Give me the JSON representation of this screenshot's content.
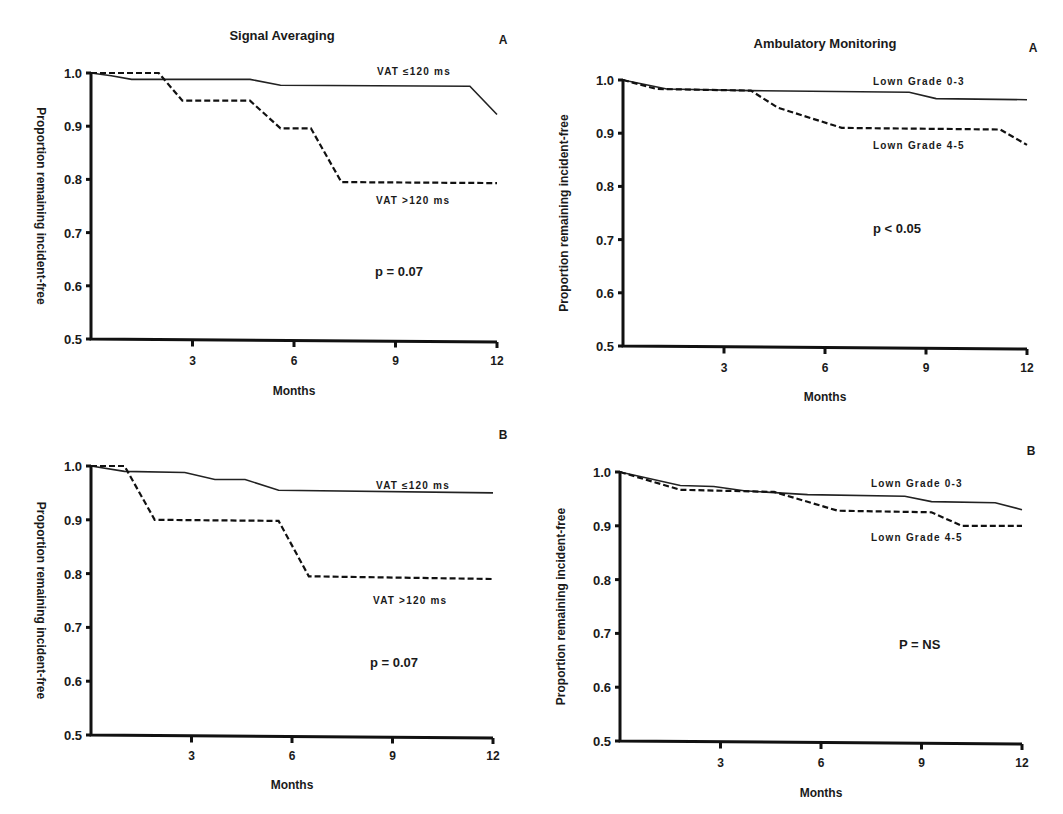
{
  "figure": {
    "left_column_title": "Signal Averaging",
    "right_column_title": "Ambulatory Monitoring"
  },
  "chart_data": [
    {
      "id": "signal-averaging-A",
      "type": "line",
      "title": "Signal Averaging",
      "panel_label": "A",
      "xlabel": "Months",
      "ylabel": "Proportion remaining incident-free",
      "xlim": [
        0,
        12
      ],
      "ylim": [
        0.5,
        1.0
      ],
      "xticks": [
        "3",
        "6",
        "9",
        "12"
      ],
      "yticks": [
        "1.0",
        "0.9",
        "0.8",
        "0.7",
        "0.6",
        "0.5"
      ],
      "grid": false,
      "annotation": "p = 0.07",
      "series": [
        {
          "name": "VAT ≤120 ms",
          "style": "solid",
          "x": [
            0,
            0.6,
            1.2,
            4.7,
            5.6,
            11.2,
            12
          ],
          "y": [
            1.0,
            0.995,
            0.988,
            0.988,
            0.977,
            0.975,
            0.922
          ]
        },
        {
          "name": "VAT >120 ms",
          "style": "dashed",
          "x": [
            0,
            2.0,
            2.7,
            4.7,
            5.6,
            6.5,
            7.4,
            12
          ],
          "y": [
            1.0,
            1.0,
            0.948,
            0.948,
            0.896,
            0.896,
            0.795,
            0.793
          ]
        }
      ]
    },
    {
      "id": "ambulatory-monitoring-A",
      "type": "line",
      "title": "Ambulatory Monitoring",
      "panel_label": "A",
      "xlabel": "Months",
      "ylabel": "Proportion remaining incident-free",
      "xlim": [
        0,
        12
      ],
      "ylim": [
        0.5,
        1.0
      ],
      "xticks": [
        "3",
        "6",
        "9",
        "12"
      ],
      "yticks": [
        "1.0",
        "0.9",
        "0.8",
        "0.7",
        "0.6",
        "0.5"
      ],
      "grid": false,
      "annotation": "p < 0.05",
      "series": [
        {
          "name": "Lown Grade 0-3",
          "style": "solid",
          "x": [
            0,
            1.3,
            3.8,
            8.5,
            9.3,
            12
          ],
          "y": [
            1.0,
            0.983,
            0.98,
            0.977,
            0.965,
            0.963
          ]
        },
        {
          "name": "Lown Grade 4-5",
          "style": "dashed",
          "x": [
            0,
            1.0,
            3.8,
            4.6,
            6.5,
            11.2,
            12
          ],
          "y": [
            1.0,
            0.983,
            0.98,
            0.948,
            0.91,
            0.907,
            0.878
          ]
        }
      ]
    },
    {
      "id": "signal-averaging-B",
      "type": "line",
      "title": "",
      "panel_label": "B",
      "xlabel": "Months",
      "ylabel": "Proportion remaining incident-free",
      "xlim": [
        0,
        12
      ],
      "ylim": [
        0.5,
        1.0
      ],
      "xticks": [
        "3",
        "6",
        "9",
        "12"
      ],
      "yticks": [
        "1.0",
        "0.9",
        "0.8",
        "0.7",
        "0.6",
        "0.5"
      ],
      "grid": false,
      "annotation": "p = 0.07",
      "series": [
        {
          "name": "VAT ≤120 ms",
          "style": "solid",
          "x": [
            0,
            1.0,
            2.8,
            3.7,
            4.6,
            5.6,
            12
          ],
          "y": [
            1.0,
            0.99,
            0.988,
            0.975,
            0.975,
            0.955,
            0.95
          ]
        },
        {
          "name": "VAT >120 ms",
          "style": "dashed",
          "x": [
            0,
            1.0,
            1.9,
            5.6,
            6.5,
            12
          ],
          "y": [
            1.0,
            1.0,
            0.9,
            0.898,
            0.795,
            0.79
          ]
        }
      ]
    },
    {
      "id": "ambulatory-monitoring-B",
      "type": "line",
      "title": "",
      "panel_label": "B",
      "xlabel": "Months",
      "ylabel": "Proportion remaining incident-free",
      "xlim": [
        0,
        12
      ],
      "ylim": [
        0.5,
        1.0
      ],
      "xticks": [
        "3",
        "6",
        "9",
        "12"
      ],
      "yticks": [
        "1.0",
        "0.9",
        "0.8",
        "0.7",
        "0.6",
        "0.5"
      ],
      "grid": false,
      "annotation": "P = NS",
      "series": [
        {
          "name": "Lown Grade 0-3",
          "style": "solid",
          "x": [
            0,
            1.8,
            2.8,
            3.7,
            5.6,
            8.5,
            9.3,
            11.2,
            12
          ],
          "y": [
            1.0,
            0.975,
            0.973,
            0.965,
            0.958,
            0.955,
            0.945,
            0.943,
            0.93
          ]
        },
        {
          "name": "Lown Grade 4-5",
          "style": "dashed",
          "x": [
            0,
            1.8,
            4.6,
            6.5,
            9.3,
            10.2,
            12
          ],
          "y": [
            1.0,
            0.967,
            0.963,
            0.928,
            0.925,
            0.9,
            0.9
          ]
        }
      ]
    }
  ]
}
